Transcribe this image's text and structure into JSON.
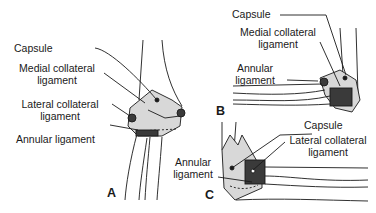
{
  "figure": {
    "panels": [
      {
        "id": "A",
        "labels": {
          "capsule": "Capsule",
          "medial_1": "Medial collateral",
          "medial_2": "ligament",
          "lateral_1": "Lateral collateral",
          "lateral_2": "ligament",
          "annular": "Annular ligament"
        }
      },
      {
        "id": "B",
        "labels": {
          "capsule": "Capsule",
          "medial_1": "Medial collateral",
          "medial_2": "ligament",
          "annular_1": "Annular",
          "annular_2": "ligament"
        }
      },
      {
        "id": "C",
        "labels": {
          "capsule": "Capsule",
          "lateral_1": "Lateral collateral",
          "lateral_2": "ligament",
          "annular_1": "Annular",
          "annular_2": "ligament"
        }
      }
    ],
    "colors": {
      "capsule_fill": "#d8d8d8",
      "line": "#1a1a1a",
      "ligament": "#3a3a3a"
    }
  }
}
